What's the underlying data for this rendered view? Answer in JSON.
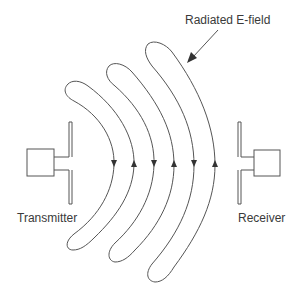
{
  "diagram": {
    "labels": {
      "transmitter": "Transmitter",
      "receiver": "Receiver",
      "field": "Radiated E-field"
    },
    "colors": {
      "stroke": "#555555",
      "text": "#3a3a3a",
      "background": "#ffffff"
    },
    "field_lines": [
      {
        "index": 1,
        "arrow_down": "left",
        "arrow_up": "right"
      },
      {
        "index": 2,
        "arrow_down": "left",
        "arrow_up": "right"
      },
      {
        "index": 3,
        "arrow_down": "left",
        "arrow_up": "right"
      }
    ]
  }
}
